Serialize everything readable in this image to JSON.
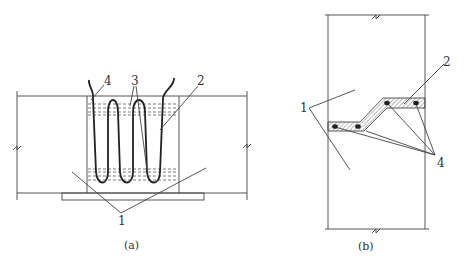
{
  "figure_a": {
    "caption": "(a)",
    "labels": {
      "l1": "1",
      "l2": "2",
      "l3": "3",
      "l4": "4"
    }
  },
  "figure_b": {
    "caption": "(b)",
    "labels": {
      "l1": "1",
      "l2": "2",
      "l4": "4"
    }
  },
  "colors": {
    "line": "#444444",
    "rebar": "#222222",
    "hatch": "#777777",
    "background": "#ffffff"
  }
}
